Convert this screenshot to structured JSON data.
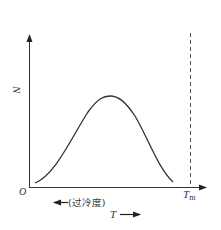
{
  "diagram": {
    "type": "nucleation-rate-vs-temperature",
    "axes": {
      "y_label": "N",
      "origin_label": "O",
      "x_marker_label": "T",
      "x_marker_subscript": "m",
      "x_direction_label": "T",
      "undercooling_label": "(过冷度)"
    },
    "curve": {
      "shape": "bell",
      "points": [
        [
          35,
          183
        ],
        [
          50,
          168
        ],
        [
          65,
          148
        ],
        [
          80,
          125
        ],
        [
          95,
          104
        ],
        [
          110,
          97
        ],
        [
          125,
          104
        ],
        [
          140,
          125
        ],
        [
          155,
          155
        ],
        [
          165,
          172
        ],
        [
          173,
          182
        ]
      ]
    },
    "dashed_line": {
      "at": "Tm",
      "style": "dashed"
    },
    "colors": {
      "stroke": "#333333",
      "dashed": "#555555",
      "background": "#ffffff"
    }
  }
}
